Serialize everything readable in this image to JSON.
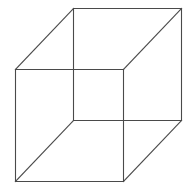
{
  "diagram": {
    "type": "wireframe-cube",
    "line_color": "#4a4a4a",
    "line_width": 1.1,
    "background": "#ffffff",
    "vertices": {
      "front_top_left": [
        15,
        69
      ],
      "front_top_right": [
        123,
        69
      ],
      "front_bottom_right": [
        123,
        181
      ],
      "front_bottom_left": [
        15,
        181
      ],
      "back_top_left": [
        73,
        8
      ],
      "back_top_right": [
        181,
        8
      ],
      "back_bottom_right": [
        181,
        120
      ],
      "back_bottom_left": [
        73,
        120
      ]
    },
    "edges": [
      {
        "name": "front-top-edge",
        "from": "front_top_left",
        "to": "front_top_right"
      },
      {
        "name": "front-right-edge",
        "from": "front_top_right",
        "to": "front_bottom_right"
      },
      {
        "name": "front-bottom-edge",
        "from": "front_bottom_right",
        "to": "front_bottom_left"
      },
      {
        "name": "front-left-edge",
        "from": "front_bottom_left",
        "to": "front_top_left"
      },
      {
        "name": "back-top-edge",
        "from": "back_top_left",
        "to": "back_top_right"
      },
      {
        "name": "back-right-edge",
        "from": "back_top_right",
        "to": "back_bottom_right"
      },
      {
        "name": "back-bottom-edge",
        "from": "back_bottom_right",
        "to": "back_bottom_left"
      },
      {
        "name": "back-left-edge",
        "from": "back_bottom_left",
        "to": "back_top_left"
      },
      {
        "name": "connector-top-left",
        "from": "front_top_left",
        "to": "back_top_left"
      },
      {
        "name": "connector-top-right",
        "from": "front_top_right",
        "to": "back_top_right"
      },
      {
        "name": "connector-bottom-right",
        "from": "front_bottom_right",
        "to": "back_bottom_right"
      },
      {
        "name": "connector-bottom-left",
        "from": "front_bottom_left",
        "to": "back_bottom_left"
      }
    ]
  }
}
